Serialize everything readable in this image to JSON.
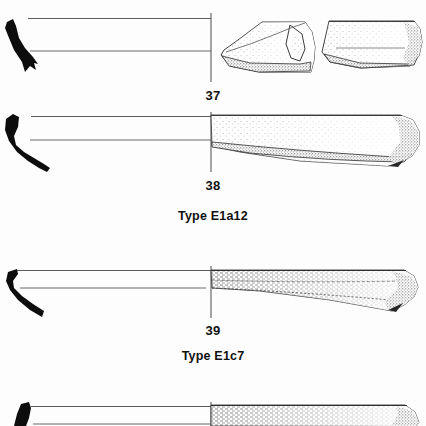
{
  "plate": {
    "kind": "archaeological-pottery-profile-plate",
    "background_color": "#fdfdfd",
    "ink_color": "#111111",
    "figures": [
      {
        "number_label": "37",
        "number_x": 213,
        "number_y": 88,
        "rim_style": "solid-black-hooked-everted-rim",
        "body_style": "two-stippled-sherd-fragments",
        "axis_x": 211,
        "top_line_y": 18,
        "bottom_line_y": 51
      },
      {
        "number_label": "38",
        "number_x": 213,
        "number_y": 178,
        "rim_style": "solid-black-curved-everted-rim",
        "body_style": "single-long-stippled-body",
        "axis_x": 211,
        "top_line_y": 116,
        "bottom_line_y": 140
      },
      {
        "number_label": "39",
        "number_x": 213,
        "number_y": 323,
        "rim_style": "thin-black-angular-hooked-rim",
        "body_style": "hatched-and-stippled-flat-body",
        "axis_x": 211,
        "top_line_y": 271,
        "bottom_line_y": 288
      },
      {
        "number_label": "",
        "rim_style": "solid-black-rounded-rim-partial",
        "body_style": "hatched-stippled-body-cropped",
        "axis_x": 211,
        "top_line_y": 406,
        "bottom_line_y": 424
      }
    ],
    "type_labels": [
      {
        "text": "Type E1a12",
        "x": 213,
        "y": 209
      },
      {
        "text": "Type E1c7",
        "x": 213,
        "y": 349
      }
    ]
  }
}
